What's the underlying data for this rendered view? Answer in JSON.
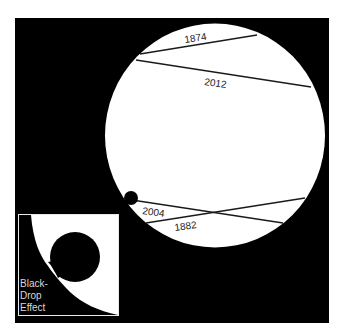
{
  "diagram": {
    "colors": {
      "background": "#ffffff",
      "sky": "#000000",
      "sun": "#ffffff",
      "venus": "#000000",
      "path_line": "#1a1a1a",
      "label": "#1a1a1a",
      "inset_border": "#e8e8e8",
      "inset_label": "#d8d8d8"
    },
    "transit_paths": [
      {
        "year": "1874",
        "label": "1874"
      },
      {
        "year": "2012",
        "label": "2012"
      },
      {
        "year": "2004",
        "label": "2004"
      },
      {
        "year": "1882",
        "label": "1882"
      }
    ],
    "inset": {
      "label_lines": [
        "Black-",
        "Drop",
        "Effect"
      ]
    }
  }
}
